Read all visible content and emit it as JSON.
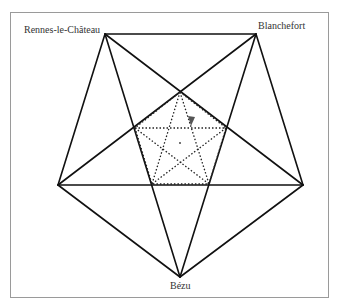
{
  "figure": {
    "labels": {
      "top_left": "Rennes-le-Château",
      "top_right": "Blanchefort",
      "bottom": "Bézu"
    },
    "colors": {
      "line": "#111111",
      "dotted": "#222222",
      "marker": "#555555",
      "border": "#9a9a9a"
    },
    "outer_vertices": {
      "top_left": [
        105,
        34
      ],
      "top_right": [
        256,
        34
      ],
      "right": [
        303,
        185
      ],
      "bottom": [
        180,
        277
      ],
      "left": [
        58,
        185
      ]
    },
    "inner_vertices": {
      "top": [
        180,
        92
      ],
      "left": [
        135,
        128
      ],
      "right": [
        226,
        128
      ],
      "bottom_left": [
        152,
        184
      ],
      "bottom_right": [
        209,
        184
      ]
    },
    "center_point": [
      180,
      143
    ],
    "marker_triangle": [
      [
        188,
        116
      ],
      [
        195,
        117
      ],
      [
        191,
        126
      ]
    ]
  }
}
